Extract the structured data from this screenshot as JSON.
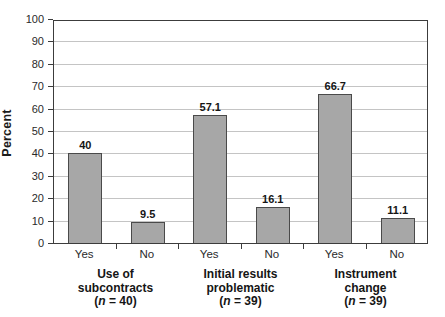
{
  "chart_data": {
    "type": "bar",
    "title": "",
    "xlabel": "",
    "ylabel": "Percent",
    "ylim": [
      0,
      100
    ],
    "yticks": [
      0,
      10,
      20,
      30,
      40,
      50,
      60,
      70,
      80,
      90,
      100
    ],
    "grid": "horizontal",
    "legend": "none",
    "categories": [
      "Yes",
      "No",
      "Yes",
      "No",
      "Yes",
      "No"
    ],
    "values": [
      40,
      9.5,
      57.1,
      16.1,
      66.7,
      11.1
    ],
    "value_labels": [
      "40",
      "9.5",
      "57.1",
      "16.1",
      "66.7",
      "11.1"
    ],
    "groups": [
      {
        "lines": [
          "Use of",
          "subcontracts"
        ],
        "n_label": "(n = 40)",
        "categories": [
          "Yes",
          "No"
        ],
        "values": [
          40,
          9.5
        ],
        "value_labels": [
          "40",
          "9.5"
        ]
      },
      {
        "lines": [
          "Initial results",
          "problematic"
        ],
        "n_label": "(n = 39)",
        "categories": [
          "Yes",
          "No"
        ],
        "values": [
          57.1,
          16.1
        ],
        "value_labels": [
          "57.1",
          "16.1"
        ]
      },
      {
        "lines": [
          "Instrument",
          "change"
        ],
        "n_label": "(n = 39)",
        "categories": [
          "Yes",
          "No"
        ],
        "values": [
          66.7,
          11.1
        ],
        "value_labels": [
          "66.7",
          "11.1"
        ]
      }
    ],
    "colors": {
      "bar_fill": "#a7a7a7",
      "bar_border": "#4a4a4a",
      "gridline": "#c4c4c4",
      "axis": "#3c3c3c",
      "text": "#1c1c1c"
    }
  }
}
